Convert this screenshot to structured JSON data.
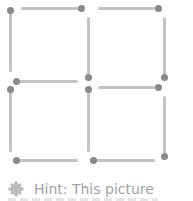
{
  "puzzle": {
    "type": "matchstick",
    "stick_color": "#c4c4c4",
    "head_color": "#8a8a8a",
    "sticks": [
      {
        "id": "tl-left",
        "orient": "v",
        "x": 9,
        "y": 9,
        "len": 63,
        "head": "start"
      },
      {
        "id": "tl-top",
        "orient": "h",
        "x": 21,
        "y": 7,
        "len": 62,
        "head": "end"
      },
      {
        "id": "tl-right",
        "orient": "v",
        "x": 87,
        "y": 17,
        "len": 62,
        "head": "end"
      },
      {
        "id": "tl-bottom",
        "orient": "h",
        "x": 15,
        "y": 80,
        "len": 63,
        "head": "start"
      },
      {
        "id": "tr-top",
        "orient": "h",
        "x": 98,
        "y": 7,
        "len": 62,
        "head": "end"
      },
      {
        "id": "tr-right",
        "orient": "v",
        "x": 163,
        "y": 17,
        "len": 62,
        "head": "end"
      },
      {
        "id": "bl-left",
        "orient": "v",
        "x": 9,
        "y": 88,
        "len": 64,
        "head": "start"
      },
      {
        "id": "bl-right",
        "orient": "v",
        "x": 87,
        "y": 88,
        "len": 64,
        "head": "start"
      },
      {
        "id": "bl-bottom",
        "orient": "h",
        "x": 15,
        "y": 159,
        "len": 63,
        "head": "start"
      },
      {
        "id": "br-top",
        "orient": "h",
        "x": 98,
        "y": 86,
        "len": 62,
        "head": "end"
      },
      {
        "id": "br-right",
        "orient": "v",
        "x": 163,
        "y": 96,
        "len": 62,
        "head": "end"
      },
      {
        "id": "br-bottom",
        "orient": "h",
        "x": 92,
        "y": 159,
        "len": 63,
        "head": "start"
      }
    ]
  },
  "hint": {
    "icon": "hint-flower-icon",
    "text": "Hint: This picture"
  }
}
